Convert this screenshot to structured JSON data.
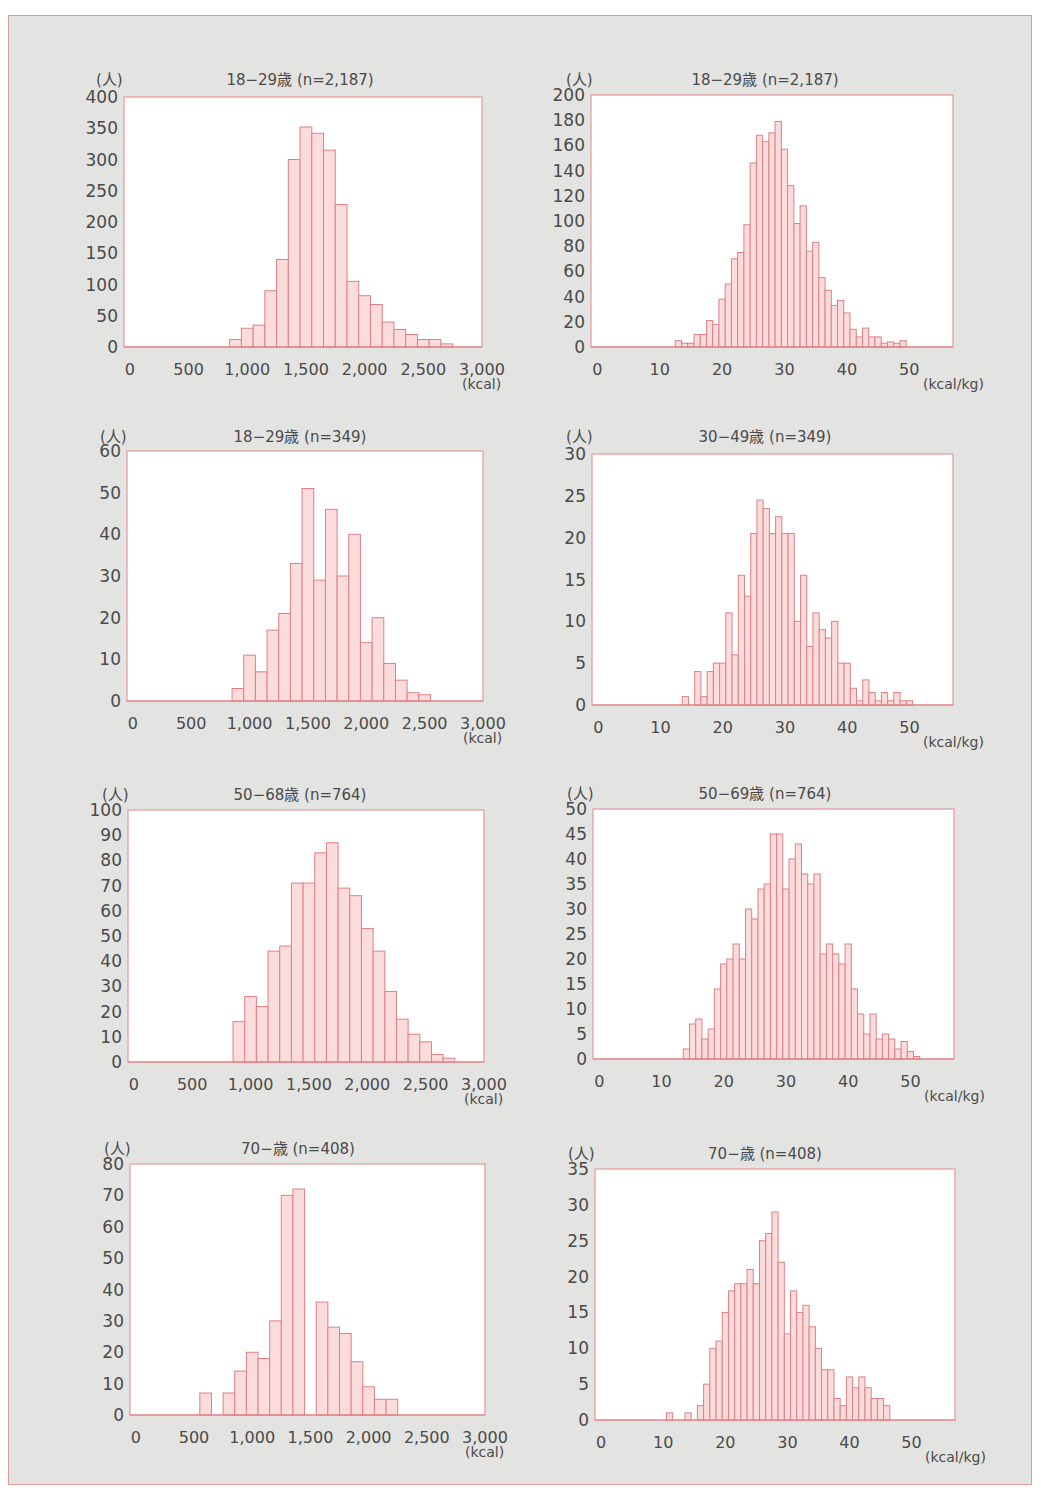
{
  "colors": {
    "page_bg": "#e3e3e1",
    "frame_border": "#e39a9a",
    "plot_bg": "#ffffff",
    "plot_border": "#e59a9a",
    "bar_fill": "#fbdcdc",
    "bar_stroke": "#e27f84",
    "text": "#4a4a4a"
  },
  "chart_data": [
    {
      "id": "c1",
      "type": "bar",
      "title": "18−29歳 (n=2,187)",
      "ylabel": "(人)",
      "xlabel": "(kcal)",
      "ylim": [
        0,
        400
      ],
      "yticks": [
        0,
        50,
        100,
        150,
        200,
        250,
        300,
        350,
        400
      ],
      "xlim": [
        -50,
        3000
      ],
      "xticks": [
        0,
        500,
        1000,
        1500,
        2000,
        2500,
        3000
      ],
      "xtick_labels": [
        "0",
        "500",
        "1,000",
        "1,500",
        "2,000",
        "2,500",
        "3,000"
      ],
      "bin_width": 100,
      "bin_start": 850,
      "values": [
        12,
        30,
        35,
        90,
        140,
        300,
        352,
        342,
        315,
        228,
        105,
        82,
        68,
        40,
        28,
        20,
        12,
        12,
        5
      ],
      "grid": false,
      "layout": {
        "left": 124,
        "top": 97,
        "width": 358,
        "height": 250,
        "title_x": 300,
        "title_y": 68,
        "unit_y_x": 96,
        "unit_y_y": 68
      }
    },
    {
      "id": "c2",
      "type": "bar",
      "title": "18−29歳 (n=2,187)",
      "ylabel": "(人)",
      "xlabel": "(kcal/kg)",
      "ylim": [
        0,
        200
      ],
      "yticks": [
        0,
        20,
        40,
        60,
        80,
        100,
        120,
        140,
        160,
        180,
        200
      ],
      "xlim": [
        -1,
        57
      ],
      "xticks": [
        0,
        10,
        20,
        30,
        40,
        50
      ],
      "xtick_labels": [
        "0",
        "10",
        "20",
        "30",
        "40",
        "50"
      ],
      "bin_width": 1,
      "bin_start": 12.5,
      "values": [
        5,
        3,
        3,
        10,
        10,
        21,
        18,
        38,
        50,
        70,
        75,
        97,
        146,
        168,
        163,
        170,
        179,
        157,
        128,
        98,
        112,
        76,
        83,
        55,
        45,
        33,
        37,
        27,
        14,
        8,
        15,
        8,
        8,
        3,
        4,
        3,
        5
      ],
      "grid": false,
      "layout": {
        "left": 591,
        "top": 95,
        "width": 362,
        "height": 252,
        "title_x": 765,
        "title_y": 68,
        "unit_y_x": 566,
        "unit_y_y": 68
      }
    },
    {
      "id": "c3",
      "type": "bar",
      "title": "18−29歳 (n=349)",
      "ylabel": "(人)",
      "xlabel": "(kcal)",
      "ylim": [
        0,
        60
      ],
      "yticks": [
        0,
        10,
        20,
        30,
        40,
        50,
        60
      ],
      "xlim": [
        -50,
        3000
      ],
      "xticks": [
        0,
        500,
        1000,
        1500,
        2000,
        2500,
        3000
      ],
      "xtick_labels": [
        "0",
        "500",
        "1,000",
        "1,500",
        "2,000",
        "2,500",
        "3,000"
      ],
      "bin_width": 100,
      "bin_start": 850,
      "values": [
        3,
        11,
        7,
        17,
        21,
        33,
        51,
        29,
        46,
        30,
        40,
        14,
        20,
        9,
        5,
        2,
        1.5
      ],
      "grid": false,
      "layout": {
        "left": 127,
        "top": 451,
        "width": 356,
        "height": 250,
        "title_x": 300,
        "title_y": 425,
        "unit_y_x": 100,
        "unit_y_y": 425
      }
    },
    {
      "id": "c4",
      "type": "bar",
      "title": "30−49歳 (n=349)",
      "ylabel": "(人)",
      "xlabel": "(kcal/kg)",
      "ylim": [
        0,
        30
      ],
      "yticks": [
        0,
        5,
        10,
        15,
        20,
        25,
        30
      ],
      "xlim": [
        -1,
        57
      ],
      "xticks": [
        0,
        10,
        20,
        30,
        40,
        50
      ],
      "xtick_labels": [
        "0",
        "10",
        "20",
        "30",
        "40",
        "50"
      ],
      "bin_width": 1,
      "bin_start": 13.5,
      "values": [
        1,
        0,
        4,
        1,
        4,
        5,
        5,
        11,
        6,
        15.5,
        13,
        20.5,
        24.5,
        23.5,
        20.5,
        22.5,
        20.5,
        20.5,
        10,
        15.5,
        7,
        11,
        9,
        8,
        10,
        5,
        5,
        2,
        0.5,
        3,
        1.5,
        0.5,
        1.5,
        0.5,
        1.5,
        0.5,
        0.5
      ],
      "grid": false,
      "layout": {
        "left": 592,
        "top": 454,
        "width": 361,
        "height": 251,
        "title_x": 765,
        "title_y": 425,
        "unit_y_x": 566,
        "unit_y_y": 425
      }
    },
    {
      "id": "c5",
      "type": "bar",
      "title": "50−68歳 (n=764)",
      "ylabel": "(人)",
      "xlabel": "(kcal)",
      "ylim": [
        0,
        100
      ],
      "yticks": [
        0,
        10,
        20,
        30,
        40,
        50,
        60,
        70,
        80,
        90,
        100
      ],
      "xlim": [
        -50,
        3000
      ],
      "xticks": [
        0,
        500,
        1000,
        1500,
        2000,
        2500,
        3000
      ],
      "xtick_labels": [
        "0",
        "500",
        "1,000",
        "1,500",
        "2,000",
        "2,500",
        "3,000"
      ],
      "bin_width": 100,
      "bin_start": 850,
      "values": [
        16,
        26,
        22,
        44,
        46,
        71,
        71,
        83,
        87,
        69,
        66,
        53,
        44,
        28,
        17,
        11,
        8,
        3,
        1.5
      ],
      "grid": false,
      "layout": {
        "left": 128,
        "top": 810,
        "width": 356,
        "height": 252,
        "title_x": 300,
        "title_y": 783,
        "unit_y_x": 102,
        "unit_y_y": 783
      }
    },
    {
      "id": "c6",
      "type": "bar",
      "title": "50−69歳 (n=764)",
      "ylabel": "(人)",
      "xlabel": "(kcal/kg)",
      "ylim": [
        0,
        50
      ],
      "yticks": [
        0,
        5,
        10,
        15,
        20,
        25,
        30,
        35,
        40,
        45,
        50
      ],
      "xlim": [
        -1,
        57
      ],
      "xticks": [
        0,
        10,
        20,
        30,
        40,
        50
      ],
      "xtick_labels": [
        "0",
        "10",
        "20",
        "30",
        "40",
        "50"
      ],
      "bin_width": 1,
      "bin_start": 13.5,
      "values": [
        2,
        7,
        8,
        4,
        6,
        14,
        19,
        20,
        23,
        20,
        30,
        28,
        34,
        35,
        45,
        45,
        34,
        40,
        43,
        37,
        35,
        37,
        21,
        23,
        21,
        19,
        23,
        14,
        9,
        5,
        9,
        4,
        5,
        4,
        2,
        3.5,
        1.5,
        0.5
      ],
      "grid": false,
      "layout": {
        "left": 593,
        "top": 809,
        "width": 361,
        "height": 250,
        "title_x": 765,
        "title_y": 782,
        "unit_y_x": 567,
        "unit_y_y": 782
      }
    },
    {
      "id": "c7",
      "type": "bar",
      "title": "70−歳 (n=408)",
      "ylabel": "(人)",
      "xlabel": "(kcal)",
      "ylim": [
        0,
        80
      ],
      "yticks": [
        0,
        10,
        20,
        30,
        40,
        50,
        60,
        70,
        80
      ],
      "xlim": [
        -50,
        3000
      ],
      "xticks": [
        0,
        500,
        1000,
        1500,
        2000,
        2500,
        3000
      ],
      "xtick_labels": [
        "0",
        "500",
        "1,000",
        "1,500",
        "2,000",
        "2,500",
        "3,000"
      ],
      "bin_width": 100,
      "bin_start": 550,
      "values": [
        7,
        0,
        7,
        14,
        20,
        18,
        30,
        70,
        72,
        0,
        36,
        28,
        26,
        17,
        9,
        5,
        5
      ],
      "grid": false,
      "layout": {
        "left": 130,
        "top": 1164,
        "width": 355,
        "height": 251,
        "title_x": 298,
        "title_y": 1137,
        "unit_y_x": 104,
        "unit_y_y": 1137
      }
    },
    {
      "id": "c8",
      "type": "bar",
      "title": "70−歳 (n=408)",
      "ylabel": "(人)",
      "xlabel": "(kcal/kg)",
      "ylim": [
        0,
        35
      ],
      "yticks": [
        0,
        5,
        10,
        15,
        20,
        25,
        30,
        35
      ],
      "xlim": [
        -1,
        57
      ],
      "xticks": [
        0,
        10,
        20,
        30,
        40,
        50
      ],
      "xtick_labels": [
        "0",
        "10",
        "20",
        "30",
        "40",
        "50"
      ],
      "bin_width": 1,
      "bin_start": 10.5,
      "values": [
        1,
        0,
        0,
        1,
        0,
        2,
        5,
        10,
        11,
        15,
        18,
        19,
        19,
        21,
        19,
        25,
        26,
        29,
        22,
        12,
        18,
        15,
        16,
        13,
        10,
        7,
        7,
        3,
        2,
        6,
        4.5,
        6,
        4.5,
        3,
        3,
        2
      ],
      "grid": false,
      "layout": {
        "left": 595,
        "top": 1169,
        "width": 360,
        "height": 251,
        "title_x": 765,
        "title_y": 1142,
        "unit_y_x": 568,
        "unit_y_y": 1142
      }
    }
  ]
}
